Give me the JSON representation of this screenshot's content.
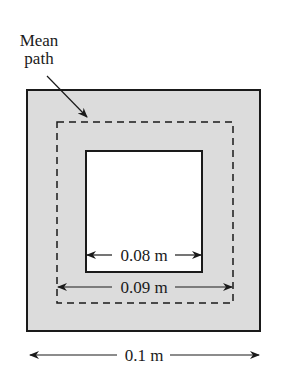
{
  "diagram": {
    "type": "magnetic-core-cross-section",
    "labels": {
      "mean_path_line1": "Mean",
      "mean_path_line2": "path",
      "inner_width": "0.08 m",
      "mean_path_width": "0.09 m",
      "outer_width": "0.1 m"
    },
    "colors": {
      "core_fill": "#dcdcdc",
      "stroke": "#1a1a1a",
      "window_fill": "#ffffff"
    },
    "shapes": {
      "outer_square": {
        "x": 27,
        "y": 90,
        "w": 233,
        "h": 241
      },
      "mean_path_square": {
        "x": 57,
        "y": 122,
        "w": 176,
        "h": 181
      },
      "inner_window": {
        "x": 86,
        "y": 151,
        "w": 116,
        "h": 121
      }
    }
  }
}
